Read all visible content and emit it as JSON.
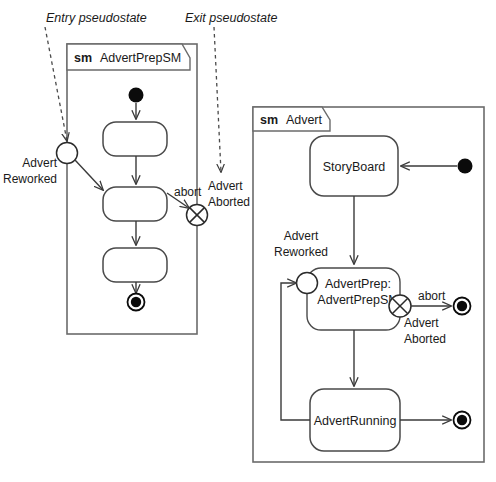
{
  "diagram": {
    "type": "uml-state-machine",
    "title_note_left": "Entry pseudostate",
    "title_note_right": "Exit pseudostate"
  },
  "annotations": [
    {
      "id": "entry-note",
      "text": "Entry pseudostate"
    },
    {
      "id": "exit-note",
      "text": "Exit pseudostate"
    }
  ],
  "left_frame": {
    "keyword": "sm",
    "name": "AdvertPrepSM",
    "states": [
      {
        "id": "state-1",
        "label": ""
      },
      {
        "id": "state-2",
        "label": ""
      },
      {
        "id": "state-3",
        "label": ""
      }
    ],
    "entry_point": {
      "name": "Advert Reworked",
      "line1": "Advert",
      "line2": "Reworked"
    },
    "exit_point": {
      "name": "Advert Aborted",
      "line1": "Advert",
      "line2": "Aborted"
    },
    "transitions": [
      {
        "id": "abort-transition",
        "label": "abort"
      }
    ]
  },
  "right_frame": {
    "keyword": "sm",
    "name": "Advert",
    "states": [
      {
        "id": "storyboard",
        "label": "StoryBoard"
      },
      {
        "id": "advertprep",
        "label_line1": "AdvertPrep:",
        "label_line2": "AdvertPrepSM"
      },
      {
        "id": "advertrunning",
        "label": "AdvertRunning"
      }
    ],
    "entry_point": {
      "line1": "Advert",
      "line2": "Reworked"
    },
    "exit_point": {
      "line1": "Advert",
      "line2": "Aborted"
    },
    "transitions": [
      {
        "id": "abort-transition-right",
        "label": "abort"
      }
    ]
  },
  "colors": {
    "frame_stroke": "#6b6b6b",
    "state_stroke": "#4a4a4a",
    "flow_stroke": "#3a3a3a",
    "node_fill": "#0b0b0b",
    "background": "#ffffff",
    "text": "#1a1a1a"
  }
}
